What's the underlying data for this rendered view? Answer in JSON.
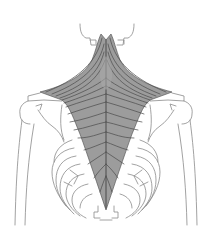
{
  "figure": {
    "subject": "Trapezius muscle, posterior view",
    "alt": "Anatomical illustration of the trapezius muscle shown from behind, over skeleton outline of skull base, shoulders, humeri and rib cage",
    "colors": {
      "background": "#ffffff",
      "muscle_fill": "#9c9c9c",
      "muscle_fiber": "#4a4a4a",
      "bone_outline": "#8a8a8a"
    }
  }
}
